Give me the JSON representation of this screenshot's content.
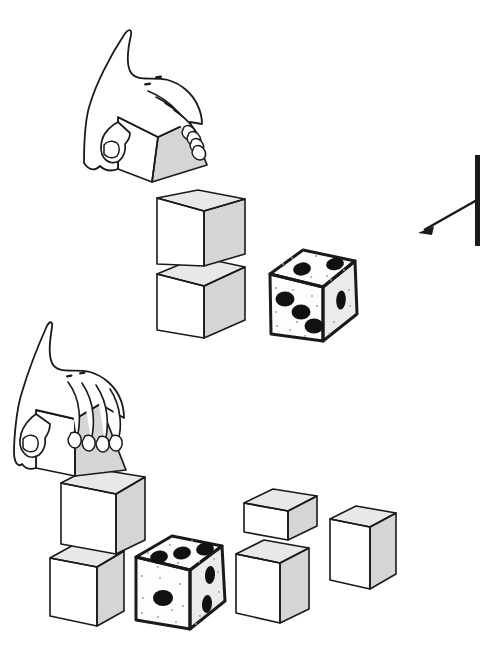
{
  "figure": {
    "background_color": "#ffffff",
    "ink_color": "#1a1a1a",
    "width": 491,
    "height": 656,
    "cube_face_colors": {
      "top": "#e8e8e8",
      "left": "#ffffff",
      "right": "#d5d5d5"
    },
    "die_colors": {
      "face": "#fdfdfd",
      "right_face": "#ebebeb",
      "pip": "#111111",
      "speck": "#9a9a9a"
    }
  },
  "panels": [
    {
      "name": "upper-panel",
      "label": "Upper scene",
      "elements": [
        {
          "name": "hand-holding-tilted-cube",
          "label": "Hand grasping a tilted cube",
          "orientation": "tilted",
          "position": {
            "x": 60,
            "y": 20
          }
        },
        {
          "name": "cube-stack-of-two",
          "label": "Vertical stack of two cubes",
          "count": 2,
          "position": {
            "x": 155,
            "y": 190
          }
        },
        {
          "name": "die-upper",
          "label": "Die beside the cube stack",
          "pips": {
            "top": 2,
            "front": 3,
            "right": 1
          },
          "position": {
            "x": 266,
            "y": 248
          }
        }
      ]
    },
    {
      "name": "lower-panel",
      "label": "Lower scene",
      "elements": [
        {
          "name": "hand-holding-upright-cube",
          "label": "Hand grasping an upright cube",
          "orientation": "upright",
          "position": {
            "x": 14,
            "y": 350
          }
        },
        {
          "name": "cube-stack-offset",
          "label": "Offset stack of two cubes",
          "count": 2,
          "position": {
            "x": 38,
            "y": 468
          }
        },
        {
          "name": "die-lower",
          "label": "Die leaning against the cube stack",
          "pips": {
            "top": 3,
            "front": 1,
            "right": 2
          },
          "position": {
            "x": 128,
            "y": 534
          }
        },
        {
          "name": "loose-cube-back-left",
          "label": "Loose cube, back left",
          "position": {
            "x": 240,
            "y": 490
          }
        },
        {
          "name": "loose-cube-back-right",
          "label": "Loose cube, back right",
          "position": {
            "x": 330,
            "y": 506
          }
        },
        {
          "name": "loose-cube-front",
          "label": "Loose cube, front",
          "position": {
            "x": 236,
            "y": 540
          }
        }
      ]
    }
  ],
  "annotation": {
    "name": "direction-arrow",
    "label": "Arrow pointing down-left toward the scene",
    "vertical_bar": {
      "x": 478,
      "y_top": 155,
      "y_bottom": 246
    },
    "arrow_from": {
      "x": 477,
      "y": 200
    },
    "arrow_to": {
      "x": 419,
      "y": 233
    },
    "color": "#1a1a1a"
  }
}
